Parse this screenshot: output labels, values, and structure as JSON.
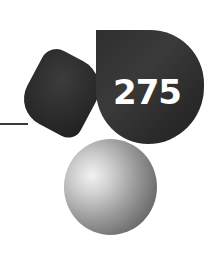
{
  "page": {
    "number": "275",
    "colors": {
      "background": "#ffffff",
      "dark_shape": "#2d2d2d",
      "number_text": "#ffffff",
      "rule_line": "#3a3a3a",
      "sphere_highlight": "#f2f2f2",
      "sphere_shadow": "#555555"
    },
    "decorations": [
      {
        "name": "rule-line"
      },
      {
        "name": "rounded-block"
      },
      {
        "name": "leaf-shape"
      },
      {
        "name": "sphere"
      }
    ]
  }
}
